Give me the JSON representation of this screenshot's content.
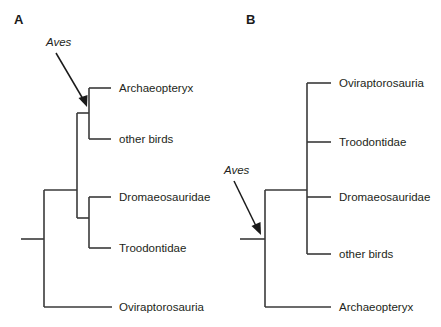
{
  "figure": {
    "background_color": "#ffffff",
    "line_color": "#3a3a3a",
    "text_color": "#231f20"
  },
  "panels": [
    {
      "letter": "A",
      "clade_annotation": {
        "label": "Aves",
        "style": "italic"
      },
      "tips": [
        {
          "label": "Archaeopteryx",
          "italic": false
        },
        {
          "label": "other birds",
          "italic": false
        },
        {
          "label": "Dromaeosauridae",
          "italic": false
        },
        {
          "label": "Troodontidae",
          "italic": false
        },
        {
          "label": "Oviraptorosauria",
          "italic": false
        }
      ]
    },
    {
      "letter": "B",
      "clade_annotation": {
        "label": "Aves",
        "style": "italic"
      },
      "tips": [
        {
          "label": "Oviraptorosauria",
          "italic": false
        },
        {
          "label": "Troodontidae",
          "italic": false
        },
        {
          "label": "Dromaeosauridae",
          "italic": false
        },
        {
          "label": "other birds",
          "italic": false
        },
        {
          "label": "Archaeopteryx",
          "italic": false
        }
      ]
    }
  ]
}
